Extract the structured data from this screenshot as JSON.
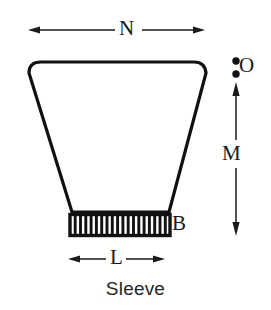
{
  "diagram": {
    "caption": "Sleeve",
    "stroke_color": "#111111",
    "background_color": "#ffffff",
    "labels": {
      "top_width": "N",
      "vertical_height": "M",
      "bottom_width": "L",
      "band": "B",
      "opening": "O"
    },
    "body": {
      "shape": "trapezoid",
      "top_left_x": 30,
      "top_right_x": 205,
      "top_y": 62,
      "bottom_left_x": 72,
      "bottom_right_x": 168,
      "bottom_y": 213,
      "corner_radius": 11
    },
    "ribbed_band": {
      "left_x": 70,
      "right_x": 170,
      "top_y": 214,
      "bottom_y": 236,
      "rib_count": 18
    },
    "dimension_n": {
      "x_start": 28,
      "x_end": 205,
      "y": 30,
      "arrowheads": "both"
    },
    "dimension_m": {
      "x": 236,
      "y_start": 88,
      "y_end": 236,
      "arrowheads": "both"
    },
    "dimension_l": {
      "x_start": 68,
      "x_end": 165,
      "y": 259,
      "arrowheads": "both"
    },
    "opening_marker": {
      "dot_x": 236,
      "dot_upper_y": 61,
      "dot_lower_y": 74,
      "dot_radius": 3.6
    }
  }
}
